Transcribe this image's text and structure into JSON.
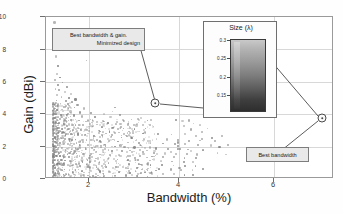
{
  "chart_data": {
    "type": "scatter",
    "title": "",
    "xlabel": "Bandwidth (%)",
    "ylabel": "Gain (dBi)",
    "xlim": [
      1.0,
      7.6
    ],
    "ylim": [
      0,
      10
    ],
    "xticks": [
      2,
      4,
      6
    ],
    "yticks": [
      0,
      2,
      4,
      6,
      8,
      10
    ],
    "grid": true,
    "legend": null,
    "series": [
      {
        "name": "designs",
        "marker_color": "#9a9a9a",
        "note": "dense cloud of ~1200 optimization designs concentrated at low bandwidth",
        "points": [
          [
            1.22,
            9.6
          ],
          [
            1.25,
            7.5
          ],
          [
            1.95,
            7.25
          ],
          [
            1.3,
            6.9
          ],
          [
            1.28,
            6.4
          ],
          [
            1.35,
            6.2
          ],
          [
            1.22,
            6.05
          ],
          [
            1.4,
            5.9
          ],
          [
            1.3,
            5.75
          ],
          [
            1.5,
            5.6
          ],
          [
            1.24,
            5.5
          ],
          [
            1.33,
            5.45
          ],
          [
            1.45,
            5.3
          ],
          [
            1.6,
            5.2
          ],
          [
            1.28,
            5.1
          ],
          [
            1.38,
            5.0
          ],
          [
            1.55,
            4.95
          ],
          [
            1.7,
            4.85
          ],
          [
            1.26,
            4.8
          ],
          [
            1.48,
            4.75
          ],
          [
            1.62,
            4.7
          ],
          [
            1.36,
            4.6
          ],
          [
            1.52,
            4.55
          ],
          [
            1.75,
            4.5
          ],
          [
            1.3,
            4.45
          ],
          [
            1.44,
            4.4
          ],
          [
            1.68,
            4.35
          ],
          [
            1.9,
            4.3
          ],
          [
            2.6,
            4.35
          ],
          [
            2.55,
            4.1
          ],
          [
            1.27,
            4.2
          ],
          [
            1.41,
            4.15
          ],
          [
            1.58,
            4.1
          ],
          [
            1.8,
            4.05
          ],
          [
            2.05,
            4.0
          ],
          [
            2.35,
            3.95
          ],
          [
            1.24,
            3.95
          ],
          [
            1.37,
            3.9
          ],
          [
            1.5,
            3.88
          ],
          [
            1.66,
            3.85
          ],
          [
            1.85,
            3.8
          ],
          [
            2.15,
            3.78
          ],
          [
            2.5,
            3.75
          ],
          [
            2.72,
            3.9
          ],
          [
            3.2,
            3.7
          ],
          [
            3.35,
            3.55
          ],
          [
            4.0,
            3.6
          ],
          [
            4.15,
            3.5
          ],
          [
            1.23,
            3.7
          ],
          [
            1.34,
            3.65
          ],
          [
            1.46,
            3.6
          ],
          [
            1.6,
            3.58
          ],
          [
            1.78,
            3.55
          ],
          [
            1.98,
            3.5
          ],
          [
            2.2,
            3.45
          ],
          [
            2.45,
            3.4
          ],
          [
            2.62,
            3.35
          ],
          [
            2.9,
            3.3
          ],
          [
            3.1,
            3.25
          ],
          [
            3.4,
            3.3
          ],
          [
            1.25,
            3.4
          ],
          [
            1.32,
            3.38
          ],
          [
            1.43,
            3.35
          ],
          [
            1.55,
            3.3
          ],
          [
            1.7,
            3.28
          ],
          [
            1.88,
            3.25
          ],
          [
            2.1,
            3.2
          ],
          [
            2.3,
            3.15
          ],
          [
            2.55,
            3.1
          ],
          [
            2.8,
            3.05
          ],
          [
            3.05,
            3.0
          ],
          [
            3.3,
            3.05
          ],
          [
            1.22,
            3.1
          ],
          [
            1.31,
            3.08
          ],
          [
            1.4,
            3.05
          ],
          [
            1.52,
            3.0
          ],
          [
            1.65,
            2.98
          ],
          [
            1.82,
            2.95
          ],
          [
            2.0,
            2.9
          ],
          [
            2.25,
            2.88
          ],
          [
            2.48,
            2.85
          ],
          [
            2.7,
            2.8
          ],
          [
            2.95,
            2.78
          ],
          [
            3.25,
            2.75
          ],
          [
            3.6,
            2.7
          ],
          [
            3.9,
            2.68
          ],
          [
            4.2,
            2.7
          ],
          [
            4.45,
            2.6
          ],
          [
            4.6,
            2.85
          ],
          [
            4.35,
            3.0
          ],
          [
            1.24,
            2.8
          ],
          [
            1.3,
            2.78
          ],
          [
            1.38,
            2.75
          ],
          [
            1.48,
            2.72
          ],
          [
            1.6,
            2.7
          ],
          [
            1.75,
            2.68
          ],
          [
            1.92,
            2.65
          ],
          [
            2.12,
            2.6
          ],
          [
            2.32,
            2.58
          ],
          [
            2.52,
            2.55
          ],
          [
            2.75,
            2.5
          ],
          [
            3.0,
            2.48
          ],
          [
            3.28,
            2.45
          ],
          [
            3.55,
            2.4
          ],
          [
            3.8,
            2.38
          ],
          [
            4.05,
            2.35
          ],
          [
            4.3,
            2.3
          ],
          [
            4.55,
            2.3
          ],
          [
            1.23,
            2.5
          ],
          [
            1.29,
            2.48
          ],
          [
            1.36,
            2.45
          ],
          [
            1.45,
            2.42
          ],
          [
            1.56,
            2.4
          ],
          [
            1.7,
            2.38
          ],
          [
            1.86,
            2.35
          ],
          [
            2.05,
            2.32
          ],
          [
            2.26,
            2.3
          ],
          [
            2.46,
            2.28
          ],
          [
            2.68,
            2.25
          ],
          [
            2.9,
            2.2
          ],
          [
            3.15,
            2.18
          ],
          [
            3.42,
            2.15
          ],
          [
            3.7,
            2.12
          ],
          [
            3.98,
            2.1
          ],
          [
            4.2,
            2.08
          ],
          [
            4.5,
            2.05
          ],
          [
            4.8,
            2.0
          ],
          [
            5.0,
            1.9
          ],
          [
            4.62,
            1.75
          ],
          [
            4.35,
            1.65
          ],
          [
            4.1,
            1.8
          ],
          [
            3.88,
            1.6
          ],
          [
            1.22,
            2.2
          ],
          [
            1.28,
            2.18
          ],
          [
            1.35,
            2.15
          ],
          [
            1.43,
            2.12
          ],
          [
            1.53,
            2.1
          ],
          [
            1.66,
            2.08
          ],
          [
            1.8,
            2.05
          ],
          [
            1.98,
            2.02
          ],
          [
            2.18,
            2.0
          ],
          [
            2.38,
            1.98
          ],
          [
            2.6,
            1.95
          ],
          [
            2.82,
            1.9
          ],
          [
            3.05,
            1.88
          ],
          [
            3.3,
            1.85
          ],
          [
            3.55,
            1.82
          ],
          [
            3.82,
            1.8
          ],
          [
            4.05,
            1.78
          ],
          [
            4.28,
            1.75
          ],
          [
            1.25,
            1.9
          ],
          [
            1.31,
            1.88
          ],
          [
            1.39,
            1.85
          ],
          [
            1.5,
            1.82
          ],
          [
            1.62,
            1.8
          ],
          [
            1.76,
            1.78
          ],
          [
            1.93,
            1.75
          ],
          [
            2.12,
            1.72
          ],
          [
            2.32,
            1.7
          ],
          [
            2.54,
            1.68
          ],
          [
            2.76,
            1.65
          ],
          [
            3.0,
            1.6
          ],
          [
            3.25,
            1.58
          ],
          [
            3.5,
            1.55
          ],
          [
            3.75,
            1.52
          ],
          [
            4.0,
            1.5
          ],
          [
            4.25,
            1.48
          ],
          [
            4.48,
            1.45
          ],
          [
            1.23,
            1.65
          ],
          [
            1.3,
            1.62
          ],
          [
            1.37,
            1.6
          ],
          [
            1.47,
            1.58
          ],
          [
            1.58,
            1.55
          ],
          [
            1.72,
            1.52
          ],
          [
            1.88,
            1.5
          ],
          [
            2.06,
            1.48
          ],
          [
            2.26,
            1.45
          ],
          [
            2.48,
            1.42
          ],
          [
            2.7,
            1.4
          ],
          [
            2.94,
            1.38
          ],
          [
            3.18,
            1.35
          ],
          [
            3.45,
            1.32
          ],
          [
            3.7,
            1.3
          ],
          [
            3.95,
            1.28
          ],
          [
            4.2,
            1.25
          ],
          [
            4.45,
            1.22
          ],
          [
            1.22,
            1.4
          ],
          [
            1.28,
            1.38
          ],
          [
            1.34,
            1.35
          ],
          [
            1.44,
            1.32
          ],
          [
            1.55,
            1.3
          ],
          [
            1.68,
            1.28
          ],
          [
            1.84,
            1.25
          ],
          [
            2.02,
            1.22
          ],
          [
            2.22,
            1.2
          ],
          [
            2.44,
            1.18
          ],
          [
            2.66,
            1.15
          ],
          [
            2.9,
            1.12
          ],
          [
            3.14,
            1.1
          ],
          [
            3.4,
            1.08
          ],
          [
            3.66,
            1.05
          ],
          [
            3.92,
            1.02
          ],
          [
            4.18,
            1.0
          ],
          [
            4.4,
            0.98
          ],
          [
            1.24,
            1.15
          ],
          [
            1.3,
            1.12
          ],
          [
            1.36,
            1.1
          ],
          [
            1.46,
            1.08
          ],
          [
            1.57,
            1.05
          ],
          [
            1.7,
            1.02
          ],
          [
            1.86,
            1.0
          ],
          [
            2.04,
            0.98
          ],
          [
            2.24,
            0.95
          ],
          [
            2.46,
            0.92
          ],
          [
            2.68,
            0.9
          ],
          [
            2.92,
            0.88
          ],
          [
            3.16,
            0.85
          ],
          [
            3.42,
            0.82
          ],
          [
            3.68,
            0.8
          ],
          [
            3.94,
            0.78
          ],
          [
            4.2,
            0.75
          ],
          [
            4.45,
            0.72
          ],
          [
            1.22,
            0.9
          ],
          [
            1.27,
            0.88
          ],
          [
            1.33,
            0.85
          ],
          [
            1.42,
            0.82
          ],
          [
            1.52,
            0.8
          ],
          [
            1.65,
            0.78
          ],
          [
            1.8,
            0.75
          ],
          [
            1.98,
            0.72
          ],
          [
            2.18,
            0.7
          ],
          [
            2.4,
            0.68
          ],
          [
            2.62,
            0.65
          ],
          [
            2.86,
            0.62
          ],
          [
            3.1,
            0.6
          ],
          [
            3.36,
            0.58
          ],
          [
            3.62,
            0.55
          ],
          [
            3.88,
            0.52
          ],
          [
            4.12,
            0.5
          ],
          [
            4.38,
            0.48
          ],
          [
            1.23,
            0.6
          ],
          [
            1.29,
            0.58
          ],
          [
            1.35,
            0.55
          ],
          [
            1.45,
            0.52
          ],
          [
            1.56,
            0.5
          ],
          [
            1.7,
            0.48
          ],
          [
            1.85,
            0.45
          ],
          [
            2.05,
            0.42
          ],
          [
            2.25,
            0.4
          ],
          [
            2.48,
            0.38
          ],
          [
            2.7,
            0.35
          ],
          [
            2.95,
            0.32
          ],
          [
            3.2,
            0.3
          ],
          [
            3.45,
            0.28
          ],
          [
            3.7,
            0.25
          ],
          [
            3.95,
            0.22
          ],
          [
            4.2,
            0.2
          ],
          [
            4.4,
            0.18
          ],
          [
            1.24,
            0.3
          ],
          [
            1.32,
            0.25
          ],
          [
            1.42,
            0.22
          ],
          [
            1.55,
            0.2
          ],
          [
            1.7,
            0.18
          ],
          [
            1.9,
            0.15
          ],
          [
            2.1,
            0.12
          ],
          [
            2.35,
            0.1
          ],
          [
            2.6,
            0.12
          ],
          [
            2.85,
            0.15
          ],
          [
            3.1,
            0.1
          ],
          [
            3.35,
            0.08
          ],
          [
            4.05,
            2.2
          ],
          [
            4.05,
            1.95
          ],
          [
            4.6,
            2.4
          ],
          [
            4.82,
            2.45
          ],
          [
            4.9,
            2.3
          ],
          [
            5.05,
            2.6
          ],
          [
            4.72,
            3.05
          ],
          [
            4.55,
            3.25
          ],
          [
            4.4,
            3.35
          ],
          [
            4.3,
            3.55
          ],
          [
            4.18,
            3.2
          ],
          [
            4.95,
            1.55
          ],
          [
            4.62,
            0.55
          ],
          [
            4.08,
            0.6
          ],
          [
            3.55,
            0.45
          ],
          [
            3.3,
            0.35
          ],
          [
            5.15,
            1.45
          ],
          [
            5.2,
            2.05
          ]
        ]
      }
    ],
    "annotations": [
      {
        "id": "best-bw-gain",
        "line1": "Best bandwidth & gain.",
        "line2": "Minimized design",
        "point": [
          3.55,
          4.7
        ]
      },
      {
        "id": "best-bw",
        "line1": "Best bandwidth",
        "line2": "",
        "point": [
          7.3,
          3.8
        ]
      }
    ],
    "inset": {
      "title": "Size (λ)",
      "yticks": [
        "0.3",
        "0.25",
        "0.2",
        "0.15"
      ],
      "description": "vertical grayscale size map of the antenna design"
    }
  },
  "figure": {
    "axis": {
      "ylabel": "Gain (dBi)",
      "xlabel": "Bandwidth (%)",
      "yticks": [
        "10",
        "8",
        "6",
        "4",
        "2",
        "0"
      ],
      "xticks": [
        "2",
        "4",
        "6"
      ]
    },
    "callouts": {
      "gain_line1": "Best bandwidth & gain.",
      "gain_line2": "Minimized design",
      "bandwidth_label": "Best bandwidth"
    },
    "inset": {
      "title": "Size (λ)",
      "tick_0": "0.3",
      "tick_1": "0.25",
      "tick_2": "0.2",
      "tick_3": "0.15"
    },
    "colors": {
      "point": "#9a9a9a",
      "axis": "#9a9a9a",
      "grid": "#d8d8d8",
      "callout_bg": "#e9e9e9",
      "callout_border": "#7d7d7d"
    }
  }
}
